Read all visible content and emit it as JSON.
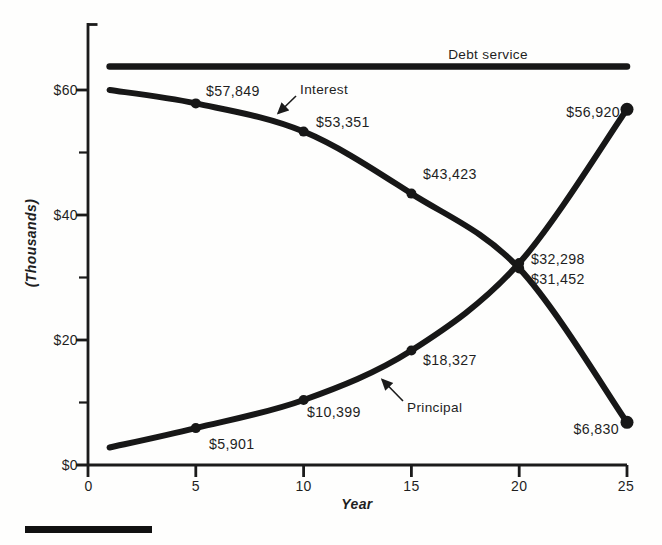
{
  "axes": {
    "y": {
      "label": "(Thousands)",
      "tick_labels": [
        "$0",
        "$20",
        "$40",
        "$60"
      ]
    },
    "x": {
      "label": "Year",
      "tick_labels": [
        "0",
        "5",
        "10",
        "15",
        "20",
        "25"
      ]
    }
  },
  "annotations": {
    "debt_service": "Debt service",
    "interest": "Interest",
    "principal": "Principal"
  },
  "point_labels": {
    "i5": "$57,849",
    "i10": "$53,351",
    "i15": "$43,423",
    "i20": "$31,452",
    "i25": "$6,830",
    "p5": "$5,901",
    "p10": "$10,399",
    "p15": "$18,327",
    "p20": "$32,298",
    "p25": "$56,920"
  },
  "colors": {
    "ink": "#1b1b1b",
    "background": "#fefefd"
  },
  "chart_data": {
    "type": "line",
    "title": "",
    "xlabel": "Year",
    "ylabel": "(Thousands)",
    "xlim": [
      0,
      25
    ],
    "ylim": [
      0,
      70000
    ],
    "grid": false,
    "x_ticks": [
      0,
      5,
      10,
      15,
      20,
      25
    ],
    "y_ticks_major": [
      0,
      20000,
      40000,
      60000
    ],
    "y_ticks_minor": [
      10000,
      30000,
      50000
    ],
    "legend_position": "inline-annotations",
    "series": [
      {
        "id": "debt-service",
        "name": "Debt service",
        "x": [
          1,
          25
        ],
        "values": [
          63750,
          63750
        ],
        "dot_years": []
      },
      {
        "id": "interest",
        "name": "Interest",
        "x": [
          1,
          5,
          10,
          15,
          20,
          25
        ],
        "values": [
          60000,
          57849,
          53351,
          43423,
          31452,
          6830
        ],
        "dot_years": [
          5,
          10,
          15,
          20,
          25
        ]
      },
      {
        "id": "principal",
        "name": "Principal",
        "x": [
          1,
          5,
          10,
          15,
          20,
          25
        ],
        "values": [
          2800,
          5901,
          10399,
          18327,
          32298,
          56920
        ],
        "dot_years": [
          5,
          10,
          15,
          20,
          25
        ]
      }
    ]
  }
}
